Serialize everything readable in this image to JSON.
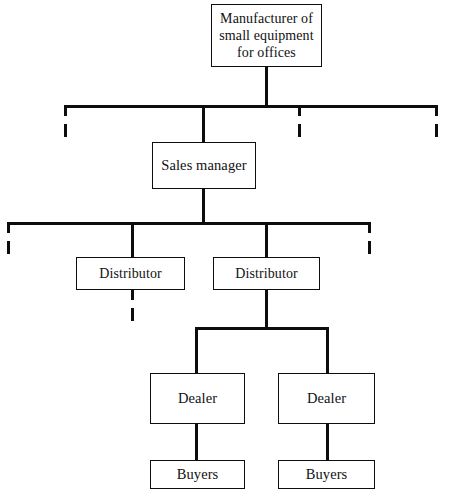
{
  "diagram": {
    "type": "organization-chart",
    "nodes": {
      "manufacturer": {
        "label": "Manufacturer of small equipment for offices"
      },
      "sales_manager": {
        "label": "Sales manager"
      },
      "distributor_left": {
        "label": "Distributor"
      },
      "distributor_right": {
        "label": "Distributor"
      },
      "dealer_left": {
        "label": "Dealer"
      },
      "dealer_right": {
        "label": "Dealer"
      },
      "buyers_left": {
        "label": "Buyers"
      },
      "buyers_right": {
        "label": "Buyers"
      }
    },
    "levels": [
      {
        "level": 1,
        "labels": [
          "Manufacturer of small equipment for offices"
        ]
      },
      {
        "level": 2,
        "labels": [
          "Sales manager"
        ]
      },
      {
        "level": 3,
        "labels": [
          "Distributor",
          "Distributor"
        ]
      },
      {
        "level": 4,
        "labels": [
          "Dealer",
          "Dealer"
        ]
      },
      {
        "level": 5,
        "labels": [
          "Buyers",
          "Buyers"
        ]
      }
    ],
    "edges": [
      {
        "from": "manufacturer",
        "to": "sales_manager",
        "style": "solid"
      },
      {
        "from": "manufacturer",
        "to": "unshown-branch-1",
        "style": "dashed"
      },
      {
        "from": "manufacturer",
        "to": "unshown-branch-2",
        "style": "dashed"
      },
      {
        "from": "manufacturer",
        "to": "unshown-branch-3",
        "style": "dashed"
      },
      {
        "from": "sales_manager",
        "to": "distributor_left",
        "style": "solid"
      },
      {
        "from": "sales_manager",
        "to": "distributor_right",
        "style": "solid"
      },
      {
        "from": "sales_manager",
        "to": "unshown-branch-4",
        "style": "dashed"
      },
      {
        "from": "sales_manager",
        "to": "unshown-branch-5",
        "style": "dashed"
      },
      {
        "from": "distributor_left",
        "to": "unshown-branch-6",
        "style": "dashed"
      },
      {
        "from": "distributor_right",
        "to": "dealer_left",
        "style": "solid"
      },
      {
        "from": "distributor_right",
        "to": "dealer_right",
        "style": "solid"
      },
      {
        "from": "dealer_left",
        "to": "buyers_left",
        "style": "solid"
      },
      {
        "from": "dealer_right",
        "to": "buyers_right",
        "style": "solid"
      }
    ],
    "colors": {
      "line": "#0d0d0d",
      "box_border": "#0d0d0d",
      "background": "#ffffff",
      "text": "#111111"
    }
  }
}
